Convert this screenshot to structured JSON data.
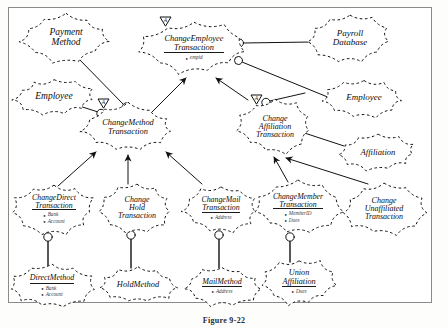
{
  "figure": {
    "caption": "Figure 9-22",
    "border_color": "#8a8a8a",
    "ink_color": "#111111",
    "background": "#ffffff"
  },
  "legend": {
    "abstract_marker": "A",
    "abstract_marker_name": "abstract-class-triangle"
  },
  "nodes": [
    {
      "id": "payment-method",
      "name": "payment-method",
      "title": "Payment\nMethod",
      "underline": false,
      "abstract": false,
      "attrs": [],
      "x": 22,
      "y": 14,
      "w": 88,
      "h": 48,
      "fs": 9.5
    },
    {
      "id": "change-employee-transaction",
      "name": "change-employee-transaction",
      "title": "ChangeEmployee\nTransaction",
      "underline": true,
      "abstract": true,
      "attrs": [
        "empid"
      ],
      "x": 142,
      "y": 22,
      "w": 104,
      "h": 52,
      "fs": 8.4
    },
    {
      "id": "payroll-database",
      "name": "payroll-database",
      "title": "Payroll\nDatabase",
      "underline": false,
      "abstract": false,
      "attrs": [],
      "x": 310,
      "y": 14,
      "w": 80,
      "h": 48,
      "fs": 9
    },
    {
      "id": "employee-left",
      "name": "employee-left",
      "title": "Employee",
      "underline": false,
      "abstract": false,
      "attrs": [],
      "x": 14,
      "y": 78,
      "w": 80,
      "h": 38,
      "fs": 9.5
    },
    {
      "id": "employee-right",
      "name": "employee-right",
      "title": "Employee",
      "underline": false,
      "abstract": false,
      "attrs": [],
      "x": 324,
      "y": 78,
      "w": 80,
      "h": 40,
      "fs": 9
    },
    {
      "id": "change-method-transaction",
      "name": "change-method-transaction",
      "title": "ChangeMethod\nTransaction",
      "underline": false,
      "abstract": true,
      "attrs": [],
      "x": 82,
      "y": 104,
      "w": 92,
      "h": 48,
      "fs": 8.4
    },
    {
      "id": "change-affiliation-transaction",
      "name": "change-affiliation-transaction",
      "title": "Change\nAffiliation\nTransaction",
      "underline": false,
      "abstract": true,
      "attrs": [],
      "x": 238,
      "y": 100,
      "w": 74,
      "h": 54,
      "fs": 8
    },
    {
      "id": "affiliation",
      "name": "affiliation",
      "title": "Affiliation",
      "underline": false,
      "abstract": false,
      "attrs": [],
      "x": 340,
      "y": 134,
      "w": 76,
      "h": 36,
      "fs": 8.6
    },
    {
      "id": "change-direct-transaction",
      "name": "change-direct-transaction",
      "title": "ChangeDirect\nTransaction",
      "underline": true,
      "abstract": false,
      "attrs": [
        "Bank",
        "Account"
      ],
      "x": 14,
      "y": 184,
      "w": 80,
      "h": 50,
      "fs": 7.8
    },
    {
      "id": "change-hold-transaction",
      "name": "change-hold-transaction",
      "title": "Change\nHold\nTransaction",
      "underline": false,
      "abstract": false,
      "attrs": [],
      "x": 100,
      "y": 182,
      "w": 74,
      "h": 52,
      "fs": 8
    },
    {
      "id": "change-mail-transaction",
      "name": "change-mail-transaction",
      "title": "ChangeMail\nTransaction",
      "underline": true,
      "abstract": false,
      "attrs": [
        "Address"
      ],
      "x": 182,
      "y": 184,
      "w": 78,
      "h": 48,
      "fs": 7.8
    },
    {
      "id": "change-member-transaction",
      "name": "change-member-transaction",
      "title": "ChangeMember\nTransaction",
      "underline": true,
      "abstract": false,
      "attrs": [
        "MemberID",
        "Dues"
      ],
      "x": 256,
      "y": 182,
      "w": 84,
      "h": 52,
      "fs": 7.8
    },
    {
      "id": "change-unaffiliated-transaction",
      "name": "change-unaffiliated-transaction",
      "title": "Change\nUnaffiliated\nTransaction",
      "underline": false,
      "abstract": false,
      "attrs": [],
      "x": 344,
      "y": 184,
      "w": 80,
      "h": 50,
      "fs": 8
    },
    {
      "id": "direct-method",
      "name": "direct-method",
      "title": "DirectMethod",
      "underline": true,
      "abstract": false,
      "attrs": [
        "Bank",
        "Account"
      ],
      "x": 12,
      "y": 264,
      "w": 80,
      "h": 44,
      "fs": 8
    },
    {
      "id": "hold-method",
      "name": "hold-method",
      "title": "HoldMethod",
      "underline": false,
      "abstract": false,
      "attrs": [],
      "x": 100,
      "y": 266,
      "w": 76,
      "h": 38,
      "fs": 8.4
    },
    {
      "id": "mail-method",
      "name": "mail-method",
      "title": "MailMethod",
      "underline": true,
      "abstract": false,
      "attrs": [
        "Address"
      ],
      "x": 184,
      "y": 266,
      "w": 76,
      "h": 40,
      "fs": 8
    },
    {
      "id": "union-affiliation",
      "name": "union-affiliation",
      "title": "Union\nAffiliation",
      "underline": true,
      "abstract": false,
      "attrs": [
        "Dues"
      ],
      "x": 262,
      "y": 258,
      "w": 74,
      "h": 48,
      "fs": 8.2
    }
  ],
  "relations": [
    {
      "name": "payment-method-to-changemethod",
      "type": "association"
    },
    {
      "name": "employee-to-changemethod",
      "type": "association"
    },
    {
      "name": "changeemployee-to-payroll-database",
      "type": "association"
    },
    {
      "name": "changeemployee-to-employee-right",
      "type": "association"
    },
    {
      "name": "changeaffiliation-to-employee-right",
      "type": "association"
    },
    {
      "name": "changeaffiliation-to-affiliation",
      "type": "association"
    },
    {
      "name": "changemethod-inherits-changeemployee",
      "type": "inheritance"
    },
    {
      "name": "changeaffiliation-inherits-changeemployee",
      "type": "inheritance"
    },
    {
      "name": "changedirect-inherits-changemethod",
      "type": "inheritance"
    },
    {
      "name": "changehold-inherits-changemethod",
      "type": "inheritance"
    },
    {
      "name": "changemail-inherits-changemethod",
      "type": "inheritance"
    },
    {
      "name": "changemember-inherits-changeaffiliation",
      "type": "inheritance"
    },
    {
      "name": "changeunaffiliated-inherits-changeaffiliation",
      "type": "inheritance"
    },
    {
      "name": "changedirect-uses-directmethod",
      "type": "association"
    },
    {
      "name": "changehold-uses-holdmethod",
      "type": "association"
    },
    {
      "name": "changemail-uses-mailmethod",
      "type": "association"
    },
    {
      "name": "changemember-uses-unionaffiliation",
      "type": "association"
    }
  ]
}
